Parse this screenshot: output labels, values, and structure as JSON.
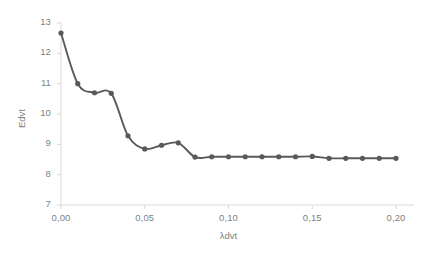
{
  "chart_data": {
    "type": "line",
    "title": "",
    "subtitle": "",
    "xlabel": "λdvt",
    "ylabel": "Edvt",
    "xlim": [
      0.0,
      0.2
    ],
    "ylim": [
      7,
      13
    ],
    "grid": false,
    "legend": null,
    "legend_position": "none",
    "smoothed": true,
    "marker": "circle",
    "line_color": "#595959",
    "marker_color": "#595959",
    "axis_color": "#d9d9d9",
    "label_color": "#7f7f7f",
    "decimal_separator": ",",
    "x_tick_labels": [
      "0,00",
      "0,05",
      "0,10",
      "0,15",
      "0,20"
    ],
    "x_tick_values": [
      0.0,
      0.05,
      0.1,
      0.15,
      0.2
    ],
    "y_tick_labels": [
      "7",
      "8",
      "9",
      "10",
      "11",
      "12",
      "13"
    ],
    "y_tick_values": [
      7,
      8,
      9,
      10,
      11,
      12,
      13
    ],
    "x": [
      0.0,
      0.01,
      0.02,
      0.03,
      0.04,
      0.05,
      0.06,
      0.07,
      0.08,
      0.09,
      0.1,
      0.11,
      0.12,
      0.13,
      0.14,
      0.15,
      0.16,
      0.17,
      0.18,
      0.19,
      0.2
    ],
    "values": [
      12.67,
      11.0,
      10.7,
      10.68,
      9.28,
      8.85,
      8.97,
      9.05,
      8.58,
      8.59,
      8.59,
      8.59,
      8.59,
      8.59,
      8.59,
      8.6,
      8.54,
      8.54,
      8.54,
      8.54,
      8.54
    ],
    "series": [
      {
        "name": "Edvt",
        "values": [
          12.67,
          11.0,
          10.7,
          10.68,
          9.28,
          8.85,
          8.97,
          9.05,
          8.58,
          8.59,
          8.59,
          8.59,
          8.59,
          8.59,
          8.59,
          8.6,
          8.54,
          8.54,
          8.54,
          8.54,
          8.54
        ]
      }
    ]
  }
}
